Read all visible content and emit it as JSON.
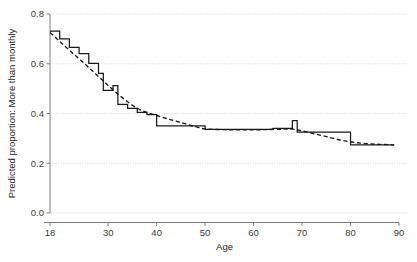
{
  "chart_data": {
    "type": "line",
    "title": "",
    "xlabel": "Age",
    "ylabel": "Predicted proportion: More than monthly",
    "xlim": [
      18,
      90
    ],
    "ylim": [
      0.0,
      0.8
    ],
    "xticks": [
      18,
      30,
      40,
      50,
      60,
      70,
      80,
      90
    ],
    "xtick_labels": [
      "18",
      "30",
      "40",
      "50",
      "60",
      "70",
      "80",
      "90"
    ],
    "yticks": [
      0.0,
      0.2,
      0.4,
      0.6,
      0.8
    ],
    "ytick_labels": [
      "0.0",
      "0.2",
      "0.4",
      "0.6",
      "0.8"
    ],
    "grid": "horizontal-dotted",
    "legend": "none",
    "series": [
      {
        "name": "Observed step function",
        "style": "solid-step",
        "step_points": [
          {
            "age": 18,
            "value": 0.731
          },
          {
            "age": 20,
            "value": 0.731
          },
          {
            "age": 20,
            "value": 0.7
          },
          {
            "age": 22,
            "value": 0.7
          },
          {
            "age": 22,
            "value": 0.666
          },
          {
            "age": 24,
            "value": 0.666
          },
          {
            "age": 24,
            "value": 0.641
          },
          {
            "age": 26,
            "value": 0.641
          },
          {
            "age": 26,
            "value": 0.602
          },
          {
            "age": 28,
            "value": 0.602
          },
          {
            "age": 28,
            "value": 0.561
          },
          {
            "age": 29,
            "value": 0.561
          },
          {
            "age": 29,
            "value": 0.493
          },
          {
            "age": 31,
            "value": 0.493
          },
          {
            "age": 31,
            "value": 0.512
          },
          {
            "age": 32,
            "value": 0.512
          },
          {
            "age": 32,
            "value": 0.437
          },
          {
            "age": 34,
            "value": 0.437
          },
          {
            "age": 34,
            "value": 0.421
          },
          {
            "age": 36,
            "value": 0.421
          },
          {
            "age": 36,
            "value": 0.405
          },
          {
            "age": 38,
            "value": 0.405
          },
          {
            "age": 38,
            "value": 0.396
          },
          {
            "age": 40,
            "value": 0.396
          },
          {
            "age": 40,
            "value": 0.35
          },
          {
            "age": 50,
            "value": 0.35
          },
          {
            "age": 50,
            "value": 0.336
          },
          {
            "age": 64,
            "value": 0.336
          },
          {
            "age": 64,
            "value": 0.34
          },
          {
            "age": 68,
            "value": 0.34
          },
          {
            "age": 68,
            "value": 0.371
          },
          {
            "age": 69,
            "value": 0.371
          },
          {
            "age": 69,
            "value": 0.325
          },
          {
            "age": 80,
            "value": 0.325
          },
          {
            "age": 80,
            "value": 0.274
          },
          {
            "age": 89,
            "value": 0.274
          }
        ]
      },
      {
        "name": "Fitted smooth curve",
        "style": "dashed",
        "points": [
          {
            "age": 18,
            "value": 0.726
          },
          {
            "age": 20,
            "value": 0.69
          },
          {
            "age": 22,
            "value": 0.654
          },
          {
            "age": 24,
            "value": 0.62
          },
          {
            "age": 26,
            "value": 0.585
          },
          {
            "age": 28,
            "value": 0.549
          },
          {
            "age": 30,
            "value": 0.513
          },
          {
            "age": 32,
            "value": 0.478
          },
          {
            "age": 34,
            "value": 0.447
          },
          {
            "age": 36,
            "value": 0.421
          },
          {
            "age": 38,
            "value": 0.404
          },
          {
            "age": 40,
            "value": 0.392
          },
          {
            "age": 42,
            "value": 0.38
          },
          {
            "age": 44,
            "value": 0.369
          },
          {
            "age": 46,
            "value": 0.358
          },
          {
            "age": 48,
            "value": 0.347
          },
          {
            "age": 50,
            "value": 0.338
          },
          {
            "age": 54,
            "value": 0.335
          },
          {
            "age": 58,
            "value": 0.334
          },
          {
            "age": 62,
            "value": 0.335
          },
          {
            "age": 66,
            "value": 0.337
          },
          {
            "age": 68,
            "value": 0.337
          },
          {
            "age": 70,
            "value": 0.33
          },
          {
            "age": 74,
            "value": 0.312
          },
          {
            "age": 78,
            "value": 0.293
          },
          {
            "age": 82,
            "value": 0.281
          },
          {
            "age": 86,
            "value": 0.276
          },
          {
            "age": 89,
            "value": 0.274
          }
        ]
      }
    ]
  }
}
